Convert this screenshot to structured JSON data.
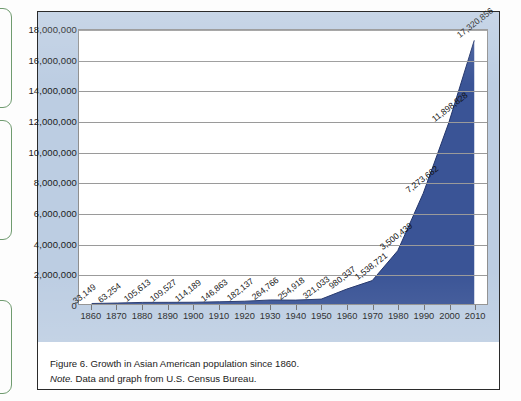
{
  "figure": {
    "caption_line1": "Figure 6. Growth in Asian American population since 1860.",
    "caption_note_label": "Note.",
    "caption_note_text": " Data and graph from U.S. Census Bureau."
  },
  "colors": {
    "area_fill": "#3a5496",
    "panel_background": "#bccde2",
    "plot_background": "#ffffff",
    "gridline": "#9a9a9a",
    "frame_border": "#2b2b2b",
    "margin_box_border": "#6f9b6f"
  },
  "chart_data": {
    "type": "area",
    "title": "",
    "subtitle": "",
    "xlabel": "",
    "ylabel": "",
    "x": [
      1860,
      1870,
      1880,
      1890,
      1900,
      1910,
      1920,
      1930,
      1940,
      1950,
      1960,
      1970,
      1980,
      1990,
      2000,
      2010
    ],
    "categories": [
      "1860",
      "1870",
      "1880",
      "1890",
      "1900",
      "1910",
      "1920",
      "1930",
      "1940",
      "1950",
      "1960",
      "1970",
      "1980",
      "1990",
      "2000",
      "2010"
    ],
    "values": [
      33149,
      63254,
      105613,
      109527,
      114189,
      146863,
      182137,
      264766,
      254918,
      321033,
      980337,
      1538721,
      3500439,
      7273662,
      11898828,
      17320856
    ],
    "point_labels": [
      "33,149",
      "63,254",
      "105,613",
      "109,527",
      "114,189",
      "146,863",
      "182,137",
      "264,766",
      "254,918",
      "321,033",
      "980,337",
      "1,538,721",
      "3,500,439",
      "7,273,662",
      "11,898,828",
      "17,320,856"
    ],
    "xlim": [
      1855,
      2015
    ],
    "ylim": [
      0,
      18000000
    ],
    "ytick_values": [
      0,
      2000000,
      4000000,
      6000000,
      8000000,
      10000000,
      12000000,
      14000000,
      16000000,
      18000000
    ],
    "ytick_labels": [
      "0",
      "2,000,000",
      "4,000,000",
      "6,000,000",
      "8,000,000",
      "10,000,000",
      "12,000,000",
      "14,000,000",
      "16,000,000",
      "18,000,000"
    ],
    "grid": true,
    "legend": false,
    "legend_position": "none",
    "series_name": "Asian American population"
  }
}
